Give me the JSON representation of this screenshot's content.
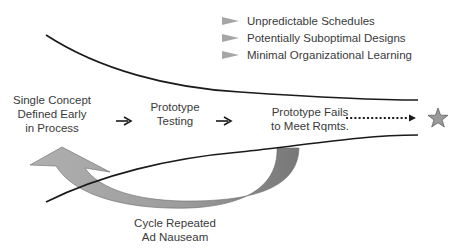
{
  "bullets": [
    {
      "icon": "triangle-bullet-icon",
      "label": "Unpredictable Schedules"
    },
    {
      "icon": "triangle-bullet-icon",
      "label": "Potentially Suboptimal Designs"
    },
    {
      "icon": "triangle-bullet-icon",
      "label": "Minimal Organizational Learning"
    }
  ],
  "steps": [
    {
      "lines": [
        "Single Concept",
        "Defined Early",
        "in Process"
      ]
    },
    {
      "lines": [
        "Prototype",
        "Testing"
      ]
    },
    {
      "lines": [
        "Prototype Fails",
        "to Meet Rqmts."
      ]
    }
  ],
  "cycle_label": {
    "lines": [
      "Cycle Repeated",
      "Ad Nauseam"
    ]
  },
  "goal_icon": "star-icon",
  "colors": {
    "line": "#1a1a1a",
    "arrow_fill": "#a8a8a8",
    "arrow_fill_dark": "#7a7a7a",
    "bullet": "#a6a6a6",
    "star": "#9a9a9a",
    "text": "#3a3a3a"
  }
}
